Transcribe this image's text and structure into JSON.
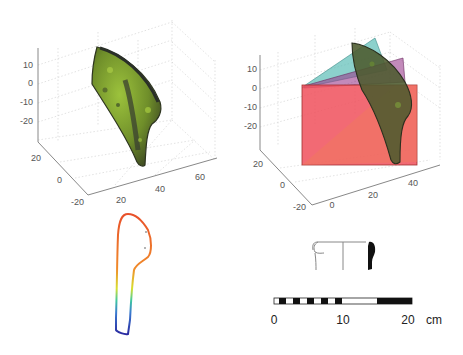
{
  "figure": {
    "panels": [
      {
        "id": "panel-a",
        "description": "3D scanned sherd surface (green mesh)",
        "z_ticks": [
          "10",
          "0",
          "-10",
          "-20"
        ],
        "y_ticks": [
          "20",
          "0",
          "-20"
        ],
        "x_ticks": [
          "20",
          "40",
          "60"
        ],
        "surface_color": "#7a9a2e"
      },
      {
        "id": "panel-b",
        "description": "3D sherd with fitted section planes",
        "z_ticks": [
          "10",
          "0",
          "-10",
          "-20"
        ],
        "y_ticks": [
          "20",
          "0",
          "-20"
        ],
        "x_ticks": [
          "0",
          "20",
          "40"
        ],
        "plane_colors": [
          "#4fb8b0",
          "#9a3c8c",
          "#f0505c"
        ]
      },
      {
        "id": "panel-c",
        "description": "extracted profile outline, colored by height (blue to red)"
      },
      {
        "id": "panel-d",
        "description": "archaeological drawing of rim profile with scale bar",
        "scale": {
          "labels": [
            "0",
            "10",
            "20"
          ],
          "unit": "cm"
        }
      }
    ]
  }
}
